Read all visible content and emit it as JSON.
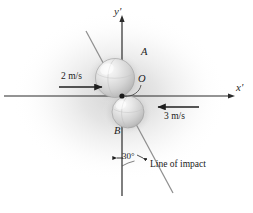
{
  "figure": {
    "width": 253,
    "height": 213,
    "background_color": "#ffffff",
    "vignette_color": "#c9c9c9",
    "line_color": "#2b2b2b",
    "sphere_fill": "#dcdcdc",
    "sphere_highlight": "#f4f4f4",
    "sphere_stroke": "#9a9a9a",
    "impact_line_color": "#8c8c8c"
  },
  "axes": {
    "x_label": "x'",
    "y_label": "y'",
    "origin_label": "O"
  },
  "bodies": [
    {
      "id": "A",
      "label": "A",
      "role": "upper-sphere"
    },
    {
      "id": "B",
      "label": "B",
      "role": "lower-sphere"
    }
  ],
  "velocities": [
    {
      "for": "A",
      "label": "2 m/s",
      "direction": "right",
      "magnitude": 2,
      "units": "m/s"
    },
    {
      "for": "B",
      "label": "3 m/s",
      "direction": "left",
      "magnitude": 3,
      "units": "m/s"
    }
  ],
  "annotations": {
    "angle_label": "30°",
    "angle_value": 30,
    "impact_line_label": "Line of impact"
  }
}
